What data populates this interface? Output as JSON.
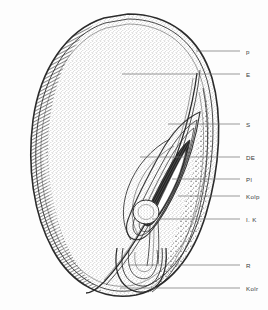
{
  "figure": {
    "type": "botanical-line-drawing",
    "background_color": "#fdfdfd",
    "ink_color": "#2b2b2b",
    "leader_color": "#6d6d6d",
    "label_color": "#3a3a3a"
  },
  "labels": [
    {
      "id": "p",
      "text": "p",
      "x": 246,
      "y": 52,
      "leader_from_x": 196,
      "leader_to_x": 240,
      "leader_y": 51,
      "target": "pericarp-outer-layer"
    },
    {
      "id": "E",
      "text": "E",
      "x": 246,
      "y": 75,
      "leader_from_x": 122,
      "leader_to_x": 240,
      "leader_y": 74,
      "target": "endosperm"
    },
    {
      "id": "S",
      "text": "S",
      "x": 246,
      "y": 125,
      "leader_from_x": 168,
      "leader_to_x": 240,
      "leader_y": 124,
      "target": "scutellum"
    },
    {
      "id": "DE",
      "text": "DE",
      "x": 246,
      "y": 158,
      "leader_from_x": 140,
      "leader_to_x": 240,
      "leader_y": 157,
      "target": "glandular-epithelium"
    },
    {
      "id": "Pl",
      "text": "Pl",
      "x": 246,
      "y": 180,
      "leader_from_x": 172,
      "leader_to_x": 240,
      "leader_y": 179,
      "target": "plumule"
    },
    {
      "id": "Kolp",
      "text": "Kolp",
      "x": 246,
      "y": 197,
      "leader_from_x": 178,
      "leader_to_x": 240,
      "leader_y": 196,
      "target": "coleoptile"
    },
    {
      "id": "IK",
      "text": "I. K",
      "x": 246,
      "y": 220,
      "leader_from_x": 152,
      "leader_to_x": 240,
      "leader_y": 219,
      "target": "inner-aleurone-layer"
    },
    {
      "id": "R",
      "text": "R",
      "x": 246,
      "y": 266,
      "leader_from_x": 128,
      "leader_to_x": 240,
      "leader_y": 265,
      "target": "radicle"
    },
    {
      "id": "Kolr",
      "text": "Kolr",
      "x": 246,
      "y": 289,
      "leader_from_x": 120,
      "leader_to_x": 240,
      "leader_y": 288,
      "target": "coleorhiza"
    }
  ]
}
